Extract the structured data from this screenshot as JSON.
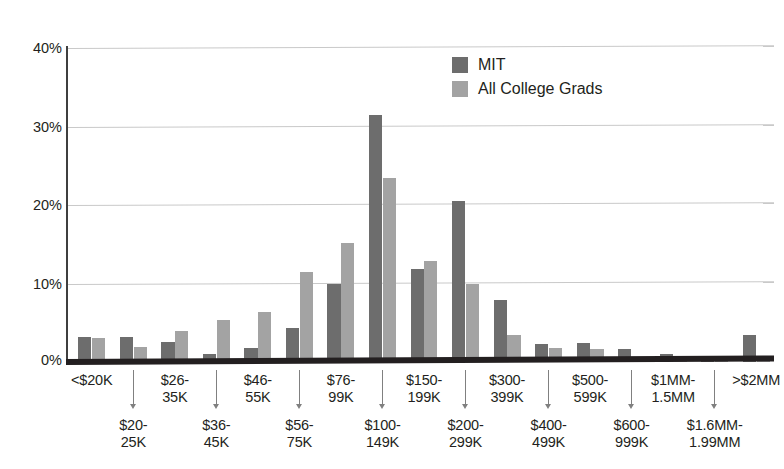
{
  "chart_data": {
    "type": "bar",
    "title": "",
    "subtitle": "",
    "xlabel": "",
    "ylabel": "",
    "ylim": [
      0,
      40
    ],
    "yticks": [
      "0%",
      "10%",
      "20%",
      "30%",
      "40%"
    ],
    "ytick_values": [
      0,
      10,
      20,
      30,
      40
    ],
    "grid": "horizontal",
    "legend_position": "top-center-right",
    "categories": [
      "<$20K",
      "$20-\n25K",
      "$26-\n35K",
      "$36-\n45K",
      "$46-\n55K",
      "$56-\n75K",
      "$76-\n99K",
      "$100-\n149K",
      "$150-\n199K",
      "$200-\n299K",
      "$300-\n399K",
      "$400-\n499K",
      "$500-\n599K",
      "$600-\n999K",
      "$1MM-\n1.5MM",
      "$1.6MM-\n1.99MM",
      ">$2MM"
    ],
    "series": [
      {
        "name": "MIT",
        "color": "#6d6d6d",
        "values": [
          3.2,
          3.2,
          2.5,
          1.0,
          1.8,
          4.3,
          10.0,
          31.5,
          11.8,
          20.5,
          7.9,
          2.3,
          2.4,
          1.6,
          1.0,
          0.3,
          3.5
        ]
      },
      {
        "name": "All College Grads",
        "color": "#a3a3a3",
        "values": [
          3.1,
          1.9,
          4.0,
          5.3,
          6.4,
          11.5,
          15.1,
          23.5,
          12.9,
          10.0,
          3.5,
          1.8,
          1.7,
          0.4,
          0.3,
          0.2,
          0.6
        ]
      }
    ]
  },
  "legend": {
    "items": [
      {
        "label": "MIT",
        "color": "#6d6d6d"
      },
      {
        "label": "All College Grads",
        "color": "#a3a3a3"
      }
    ]
  },
  "axis": {
    "y_ticks": [
      "40%",
      "30%",
      "20%",
      "10%",
      "0%"
    ]
  }
}
